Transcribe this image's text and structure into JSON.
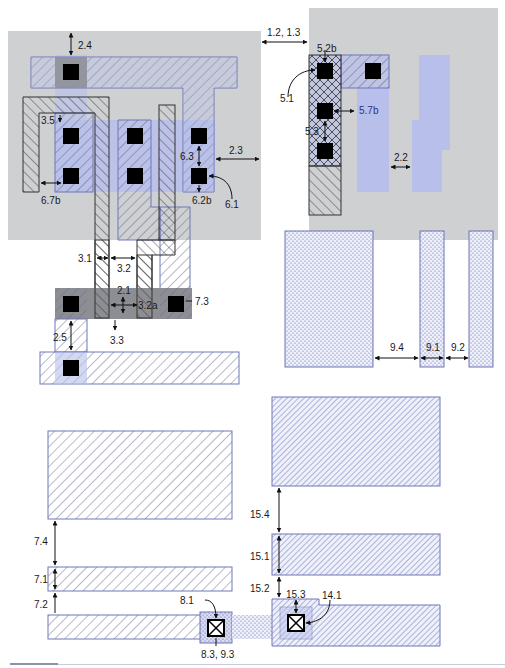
{
  "diagram": {
    "title": "",
    "colors": {
      "well_gray": "#cfd0d2",
      "active_blue": "#b8bfeb",
      "diffusion_dark": "#8d8e93",
      "outline_blue": "#6f76b8",
      "outline_black": "#333333",
      "contact_black": "#000000",
      "hatch_line": "#4a4f7a"
    },
    "rule_labels": {
      "r2_4": "2.4",
      "r1_2_1_3": "1.2, 1.3",
      "r5_2b": "5.2b",
      "r5_1": "5.1",
      "r5_7b": "5.7b",
      "r5_3": "5.3",
      "r3_5": "3.5",
      "r6_3": "6.3",
      "r2_3": "2.3",
      "r2_2": "2.2",
      "r6_7b": "6.7b",
      "r6_2b": "6.2b",
      "r6_1": "6.1",
      "r3_1": "3.1",
      "r3_2": "3.2",
      "r2_1": "2.1",
      "r3_2a": "3.2a",
      "r7_3": "7.3",
      "r3_3": "3.3",
      "r2_5": "2.5",
      "r9_4": "9.4",
      "r9_1": "9.1",
      "r9_2": "9.2",
      "r7_4": "7.4",
      "r7_1": "7.1",
      "r7_2": "7.2",
      "r8_1": "8.1",
      "r8_3_9_3": "8.3, 9.3",
      "r15_4": "15.4",
      "r15_1": "15.1",
      "r15_2": "15.2",
      "r15_3": "15.3",
      "r14_1": "14.1"
    }
  }
}
